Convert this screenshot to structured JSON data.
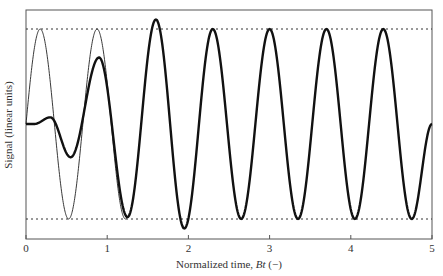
{
  "chart_data": {
    "type": "line",
    "title": "",
    "xlabel": "Normalized time, Bt (−)",
    "xlabel_parts": {
      "prefix": "Normalized time, ",
      "italic": "Bt",
      "suffix": " (−)"
    },
    "ylabel": "Signal (linear units)",
    "xlim": [
      0,
      5
    ],
    "ylim": [
      -1.25,
      1.25
    ],
    "x_ticks": [
      "0",
      "1",
      "2",
      "3",
      "4",
      "5"
    ],
    "y_ticks": [],
    "grid": false,
    "legend": null,
    "reference_lines": [
      {
        "y": 1.0,
        "style": "dotted"
      },
      {
        "y": -1.0,
        "style": "dotted"
      }
    ],
    "series": [
      {
        "name": "reference sinusoid (thin)",
        "style": "thin",
        "frequency_period": 0.7,
        "x": [
          0,
          0.175,
          0.35,
          0.525,
          0.7,
          0.875,
          1.05
        ],
        "y": [
          0,
          1.0,
          0,
          -1.0,
          0,
          1.0,
          0
        ],
        "note": "visible from 0 to ~1.2, overlaps thick curve thereafter"
      },
      {
        "name": "response signal (thick)",
        "style": "thick",
        "x": [
          0,
          0.1,
          0.3,
          0.55,
          0.9,
          1.25,
          1.6,
          1.95,
          2.3,
          2.65,
          3.0,
          3.35,
          3.7,
          4.05,
          4.4,
          4.75,
          5.0
        ],
        "y": [
          0,
          0,
          0.07,
          -0.35,
          0.7,
          -0.98,
          1.1,
          -1.1,
          1.0,
          -1.0,
          1.0,
          -1.0,
          1.0,
          -1.0,
          1.0,
          -1.0,
          0.0
        ]
      }
    ]
  }
}
